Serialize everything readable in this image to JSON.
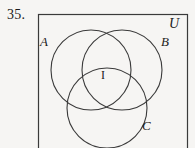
{
  "figure": {
    "problem_number": "35.",
    "type": "venn-diagram-three-sets",
    "universe_label": "U",
    "region_label": "I",
    "sets": [
      {
        "id": "A",
        "label": "A",
        "cx": 91,
        "cy": 70,
        "r": 40
      },
      {
        "id": "B",
        "label": "B",
        "cx": 122,
        "cy": 70,
        "r": 40
      },
      {
        "id": "C",
        "label": "C",
        "cx": 107,
        "cy": 108,
        "r": 40
      }
    ],
    "universe_rect": {
      "x": 38,
      "y": 14,
      "width": 150,
      "height": 140
    },
    "colors": {
      "background": "#f6f5f3",
      "stroke": "#3a3a3a",
      "text": "#1b1b1b"
    },
    "stroke_width": 1
  }
}
